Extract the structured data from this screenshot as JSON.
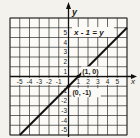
{
  "chart_data": {
    "type": "line",
    "title": "",
    "equation_label": "x - 1 = y",
    "xlabel": "x",
    "ylabel": "y",
    "xlim": [
      -6,
      6
    ],
    "ylim": [
      -6,
      6
    ],
    "grid": true,
    "x_ticks": [
      -5,
      -4,
      -3,
      -2,
      -1,
      1,
      2,
      3,
      4,
      5
    ],
    "x_tick_labels": [
      "-5",
      "-4",
      "-3",
      "-2",
      "-1",
      "1",
      "2",
      "3",
      "4",
      "5"
    ],
    "y_ticks": [
      5,
      4,
      3,
      2,
      1,
      -1,
      -2,
      -3,
      -4,
      -5
    ],
    "y_tick_labels": [
      "5",
      "4",
      "3",
      "2",
      "1",
      "-1",
      "-2",
      "-3",
      "-4",
      "-5"
    ],
    "series": [
      {
        "name": "x - 1 = y",
        "x": [
          -5,
          6
        ],
        "y": [
          -6,
          5
        ],
        "color": "#111111"
      }
    ],
    "points": [
      {
        "x": 1,
        "y": 0,
        "label": "(1, 0)"
      },
      {
        "x": 0,
        "y": -1,
        "label": "(0, -1)"
      }
    ],
    "colors": {
      "background": "#f4f2ec",
      "grid": "#2a2a2a",
      "line": "#111111"
    }
  }
}
